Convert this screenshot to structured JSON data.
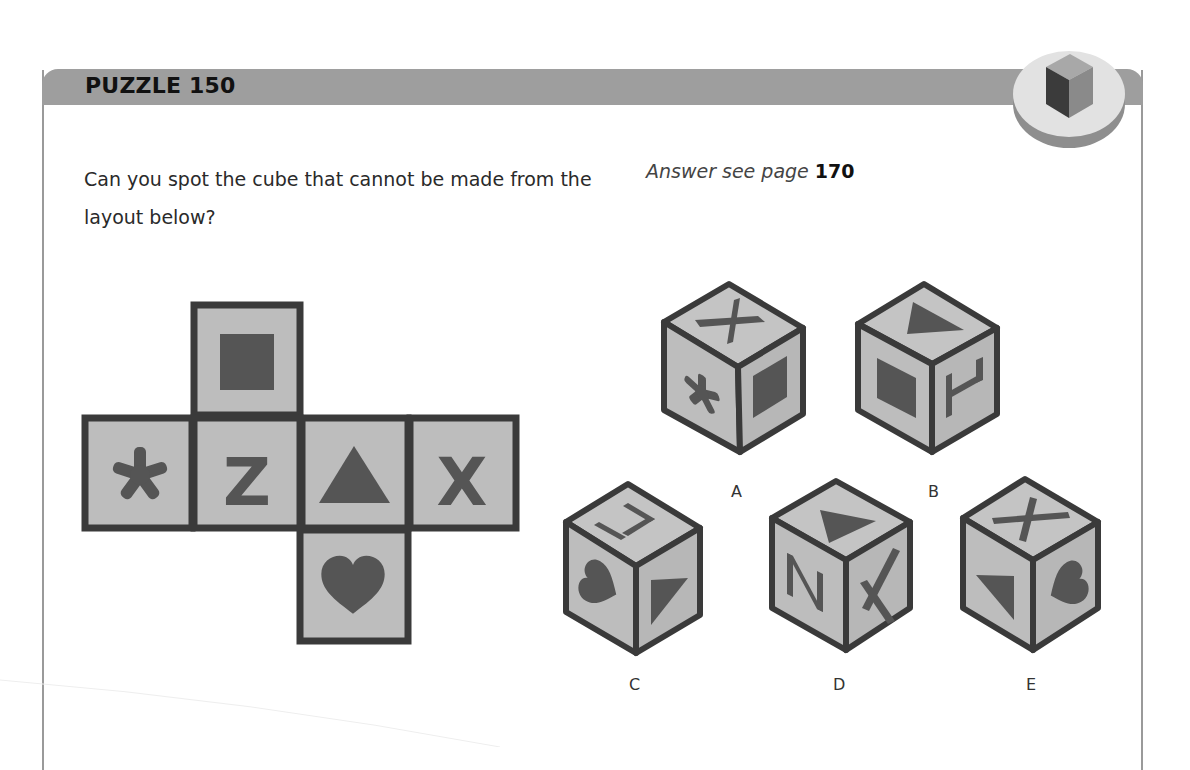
{
  "header": {
    "title": "PUZZLE 150",
    "icon": "cube-badge-icon"
  },
  "question": {
    "text": "Can you spot the cube that cannot be made from the layout below?"
  },
  "answer": {
    "prefix": "Answer see page",
    "page": "170"
  },
  "net": {
    "faces": [
      {
        "position": "top",
        "symbol": "square"
      },
      {
        "position": "row-1",
        "symbol": "asterisk"
      },
      {
        "position": "row-2",
        "symbol": "Z"
      },
      {
        "position": "row-3",
        "symbol": "triangle"
      },
      {
        "position": "row-4",
        "symbol": "X"
      },
      {
        "position": "bottom",
        "symbol": "heart"
      }
    ]
  },
  "options": [
    {
      "label": "A",
      "top": "X",
      "left": "asterisk",
      "right": "square"
    },
    {
      "label": "B",
      "top": "triangle",
      "left": "square",
      "right": "Z"
    },
    {
      "label": "C",
      "top": "Z",
      "left": "heart",
      "right": "triangle"
    },
    {
      "label": "D",
      "top": "triangle",
      "left": "Z",
      "right": "X"
    },
    {
      "label": "E",
      "top": "X",
      "left": "triangle",
      "right": "heart"
    }
  ],
  "colors": {
    "header": "#9e9e9e",
    "face": "#bdbdbd",
    "outline": "#3a3a3a",
    "symbol": "#555555"
  }
}
